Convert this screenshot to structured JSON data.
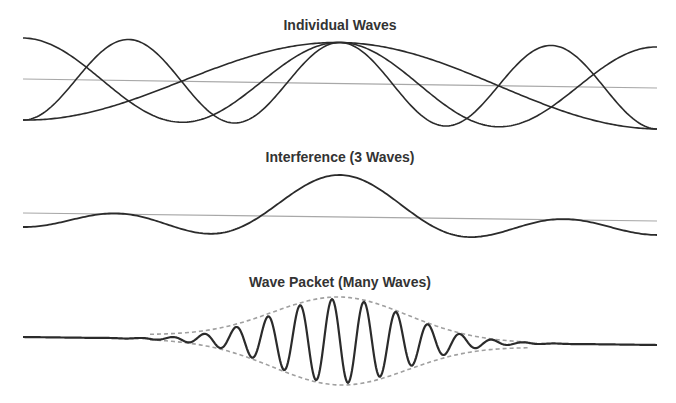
{
  "colors": {
    "wave": "#2b2b2b",
    "baseline": "#a8a8a8",
    "envelope": "#a0a0a0",
    "background": "#ffffff"
  },
  "panels": [
    {
      "id": "individual",
      "title": "Individual Waves",
      "title_y": 30,
      "x_start": 23,
      "x_end": 657,
      "center_x": 340,
      "baseline_left_y": 79,
      "baseline_right_y": 88,
      "amplitude": 41,
      "waves": [
        {
          "name": "slow-wave",
          "periods_half_span": 0.5
        },
        {
          "name": "medium-wave",
          "periods_half_span": 1.0
        },
        {
          "name": "fast-wave",
          "periods_half_span": 1.5
        }
      ]
    },
    {
      "id": "interference",
      "title": "Interference (3 Waves)",
      "title_y": 162,
      "x_start": 23,
      "x_end": 657,
      "center_x": 340,
      "baseline_left_y": 213,
      "baseline_right_y": 221,
      "amplitude": 14,
      "description": "Sum of the three individual waves"
    },
    {
      "id": "packet",
      "title": "Wave Packet (Many Waves)",
      "title_y": 287,
      "x_start": 23,
      "x_end": 657,
      "center_x": 340,
      "baseline_left_y": 337,
      "baseline_right_y": 345,
      "envelope_amplitude": 42,
      "envelope_width": 95,
      "carrier_wavelength": 32
    }
  ]
}
